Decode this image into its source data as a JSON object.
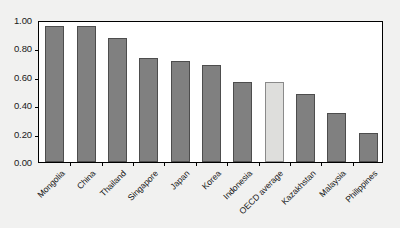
{
  "chart_data": {
    "type": "bar",
    "title": "",
    "subtitle": "",
    "xlabel": "",
    "ylabel": "",
    "ylim": [
      0.0,
      1.0
    ],
    "grid": false,
    "legend": "none",
    "categories": [
      "Mongolia",
      "China",
      "Thailand",
      "Singapore",
      "Japan",
      "Korea",
      "Indonesia",
      "OECD average",
      "Kazakhstan",
      "Malaysia",
      "Philippines"
    ],
    "values": [
      0.96,
      0.96,
      0.87,
      0.735,
      0.71,
      0.68,
      0.56,
      0.56,
      0.48,
      0.345,
      0.205
    ],
    "highlight_index": 7,
    "ytick_labels": [
      "1.00",
      "0.80",
      "0.60",
      "0.40",
      "0.20",
      "0.00"
    ],
    "ytick_values": [
      1.0,
      0.8,
      0.6,
      0.4,
      0.2,
      0.0
    ],
    "colors": {
      "bar": "#808080",
      "bar_outline": "#4d4d4d",
      "bar_highlight": "#dededc",
      "plot_background": "#ffffff",
      "page_background": "#f1f1f0",
      "axis": "#000000",
      "text": "#161616"
    }
  }
}
